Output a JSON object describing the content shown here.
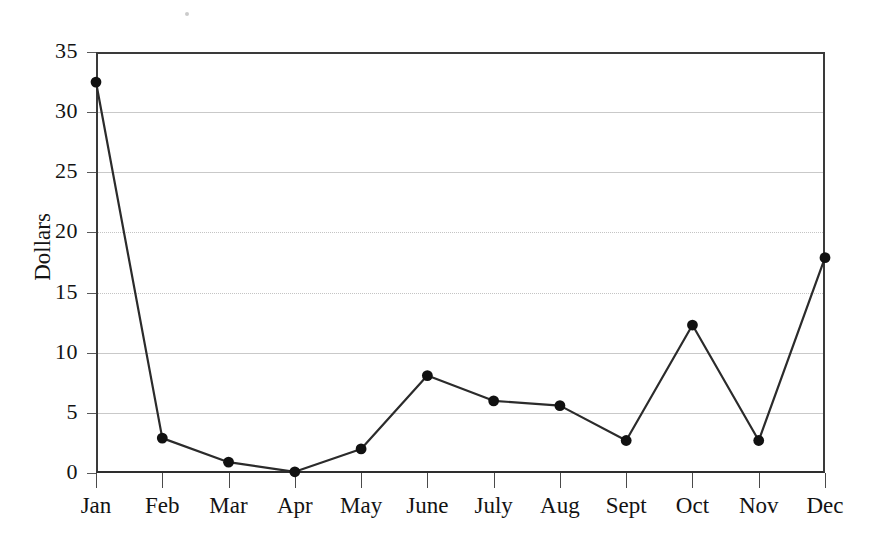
{
  "chart_data": {
    "type": "line",
    "title": "",
    "xlabel": "",
    "ylabel": "Dollars",
    "categories": [
      "Jan",
      "Feb",
      "Mar",
      "Apr",
      "May",
      "June",
      "July",
      "Aug",
      "Sept",
      "Oct",
      "Nov",
      "Dec"
    ],
    "values": [
      32.5,
      2.9,
      0.9,
      0.1,
      2.0,
      8.1,
      6.0,
      5.6,
      2.7,
      12.3,
      2.7,
      17.9
    ],
    "series": [
      {
        "name": "Dollars",
        "values": [
          32.5,
          2.9,
          0.9,
          0.1,
          2.0,
          8.1,
          6.0,
          5.6,
          2.7,
          12.3,
          2.7,
          17.9
        ]
      }
    ],
    "ylim": [
      0,
      35
    ],
    "yticks": [
      0,
      5,
      10,
      15,
      20,
      25,
      30,
      35
    ],
    "ytick_labels": [
      "0",
      "5",
      "10",
      "15",
      "20",
      "25",
      "30",
      "35"
    ],
    "grid": true,
    "grid_axis": "y",
    "legend": false,
    "legend_position": "none",
    "marker": "filled-circle",
    "line_color": "#2b2b2b",
    "marker_color": "#111111",
    "grid_color": "#c9c9c9",
    "axis_color": "#3a3a3a",
    "background": "#ffffff"
  }
}
